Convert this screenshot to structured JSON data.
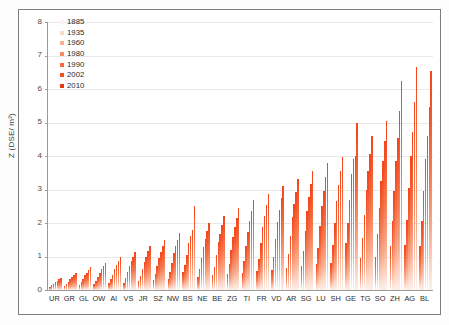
{
  "chart_data": {
    "type": "bar",
    "title": "",
    "subtitle": "",
    "xlabel": "",
    "ylabel": "Z (DSE/ m²)",
    "ylim": [
      0,
      8
    ],
    "ytick_labels": [
      "0",
      "1",
      "2",
      "3",
      "4",
      "5",
      "6",
      "7",
      "8"
    ],
    "ytick_values": [
      0,
      1,
      2,
      3,
      4,
      5,
      6,
      7,
      8
    ],
    "grid": true,
    "legend_position": "top-left-inside",
    "categories": [
      "UR",
      "GR",
      "GL",
      "OW",
      "AI",
      "VS",
      "JR",
      "SZ",
      "NW",
      "BS",
      "NE",
      "BE",
      "ZG",
      "TI",
      "FR",
      "VD",
      "AR",
      "SG",
      "LU",
      "SH",
      "GE",
      "TG",
      "SO",
      "ZH",
      "AG",
      "BL"
    ],
    "series": [
      {
        "name": "1885",
        "color": "#fdf2ec",
        "values": [
          0.1,
          0.12,
          0.16,
          0.18,
          0.2,
          0.22,
          0.26,
          0.3,
          0.33,
          0.55,
          0.4,
          0.44,
          0.48,
          0.52,
          0.56,
          0.6,
          0.66,
          0.72,
          0.78,
          0.82,
          1.4,
          0.95,
          1.0,
          1.3,
          1.35,
          1.3
        ]
      },
      {
        "name": "1935",
        "color": "#fbd9c9",
        "values": [
          0.14,
          0.18,
          0.24,
          0.28,
          0.32,
          0.36,
          0.42,
          0.48,
          0.54,
          0.75,
          0.64,
          0.7,
          0.78,
          0.86,
          0.92,
          1.0,
          1.08,
          1.16,
          1.26,
          1.34,
          2.0,
          1.55,
          1.66,
          2.05,
          2.1,
          2.05
        ]
      },
      {
        "name": "1960",
        "color": "#f9b191",
        "values": [
          0.18,
          0.24,
          0.34,
          0.4,
          0.46,
          0.54,
          0.62,
          0.72,
          0.82,
          1.05,
          0.95,
          1.05,
          1.18,
          1.3,
          1.4,
          1.52,
          1.62,
          1.76,
          1.9,
          2.0,
          2.7,
          2.25,
          2.45,
          2.95,
          3.05,
          2.95
        ]
      },
      {
        "name": "1980",
        "color": "#f7895e",
        "values": [
          0.24,
          0.32,
          0.44,
          0.52,
          0.62,
          0.72,
          0.84,
          0.96,
          1.1,
          1.4,
          1.28,
          1.42,
          1.58,
          1.74,
          1.88,
          2.02,
          2.18,
          2.36,
          2.52,
          2.66,
          3.45,
          3.0,
          3.25,
          3.85,
          4.0,
          3.9
        ]
      },
      {
        "name": "1990",
        "color": "#f56a3b",
        "values": [
          0.28,
          0.38,
          0.52,
          0.62,
          0.74,
          0.86,
          1.0,
          1.14,
          1.3,
          1.62,
          1.52,
          1.68,
          1.88,
          2.06,
          2.22,
          2.4,
          2.58,
          2.78,
          2.96,
          3.12,
          3.9,
          3.55,
          3.85,
          4.55,
          4.72,
          4.6
        ]
      },
      {
        "name": "2002",
        "color": "#f05021",
        "values": [
          0.32,
          0.44,
          0.6,
          0.72,
          0.86,
          1.0,
          1.16,
          1.32,
          1.5,
          1.8,
          1.76,
          1.94,
          2.16,
          2.36,
          2.54,
          2.74,
          2.94,
          3.16,
          3.36,
          3.54,
          4.0,
          4.05,
          4.45,
          5.35,
          5.6,
          5.45
        ]
      },
      {
        "name": "2010",
        "color": "#e8380d",
        "values": [
          0.36,
          0.5,
          0.68,
          0.82,
          0.98,
          1.14,
          1.32,
          1.5,
          1.7,
          2.5,
          2.0,
          2.2,
          2.45,
          2.68,
          2.88,
          3.1,
          3.32,
          3.56,
          3.78,
          3.98,
          5.0,
          4.6,
          5.05,
          6.25,
          6.65,
          6.55
        ]
      }
    ]
  },
  "legend": {
    "items": [
      {
        "label": "1885"
      },
      {
        "label": "1935"
      },
      {
        "label": "1960"
      },
      {
        "label": "1980"
      },
      {
        "label": "1990"
      },
      {
        "label": "2002"
      },
      {
        "label": "2010"
      }
    ]
  }
}
